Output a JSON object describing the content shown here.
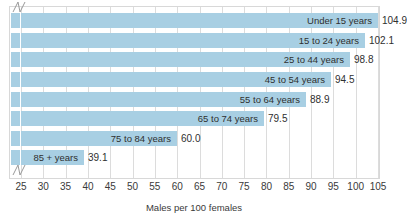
{
  "chart_data": {
    "type": "bar",
    "orientation": "horizontal",
    "title": "",
    "subtitle": "",
    "xlabel": "Males per 100 females",
    "ylabel": "",
    "categories": [
      "Under 15 years",
      "15 to 24 years",
      "25 to 44 years",
      "45 to 54 years",
      "55 to 64 years",
      "65 to 74 years",
      "75 to 84 years",
      "85 + years"
    ],
    "values": [
      104.9,
      102.1,
      98.8,
      94.5,
      88.9,
      79.5,
      60.0,
      39.1
    ],
    "value_labels": [
      "104.9",
      "102.1",
      "98.8",
      "94.5",
      "88.9",
      "79.5",
      "60.0",
      "39.1"
    ],
    "xlim": [
      25,
      105
    ],
    "xticks": [
      25,
      30,
      35,
      40,
      45,
      50,
      55,
      60,
      65,
      70,
      75,
      80,
      85,
      90,
      95,
      100,
      105
    ],
    "xtick_labels": [
      "25",
      "30",
      "35",
      "40",
      "45",
      "50",
      "55",
      "60",
      "65",
      "70",
      "75",
      "80",
      "85",
      "90",
      "95",
      "100",
      "105"
    ],
    "axis_break": true,
    "axis_break_note": "x-axis broken between 0 and 25",
    "grid": "vertical",
    "legend": "none",
    "bar_color": "#a8cfe3",
    "grid_color": "#dcdcdc",
    "frame_color": "#d8d8d8",
    "text_color": "#2f2f2f"
  }
}
